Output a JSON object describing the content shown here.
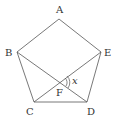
{
  "diagram": {
    "type": "regular pentagon with diagonals",
    "stroke_color": "#555555",
    "vertices": {
      "A": {
        "label": "A",
        "x": 59,
        "y": 19
      },
      "B": {
        "label": "B",
        "x": 17,
        "y": 52
      },
      "E": {
        "label": "E",
        "x": 101,
        "y": 52
      },
      "C": {
        "label": "C",
        "x": 34,
        "y": 102
      },
      "D": {
        "label": "D",
        "x": 87,
        "y": 102
      }
    },
    "intersection": {
      "label": "F",
      "x": 60,
      "y": 82
    },
    "angle_label": "x",
    "segments": [
      "AB",
      "BC",
      "CD",
      "DE",
      "EA",
      "BD",
      "CE"
    ]
  }
}
